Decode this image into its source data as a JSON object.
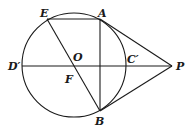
{
  "diagram": {
    "type": "geometry",
    "circle": {
      "center": "O",
      "cx": 74,
      "cy": 65,
      "r": 52
    },
    "points": {
      "E": {
        "x": 47,
        "y": 19,
        "label": "E"
      },
      "A": {
        "x": 100,
        "y": 19,
        "label": "A"
      },
      "O": {
        "x": 74,
        "y": 65,
        "label": "O"
      },
      "F": {
        "x": 74,
        "y": 66,
        "label": "F"
      },
      "D": {
        "x": 22,
        "y": 66,
        "label": "D′"
      },
      "C": {
        "x": 126,
        "y": 66,
        "label": "C′"
      },
      "P": {
        "x": 172,
        "y": 66,
        "label": "P"
      },
      "B": {
        "x": 100,
        "y": 111,
        "label": "B"
      }
    },
    "segments": [
      [
        "E",
        "A"
      ],
      [
        "A",
        "B"
      ],
      [
        "E",
        "B"
      ],
      [
        "D",
        "P"
      ],
      [
        "A",
        "P"
      ],
      [
        "B",
        "P"
      ]
    ]
  }
}
